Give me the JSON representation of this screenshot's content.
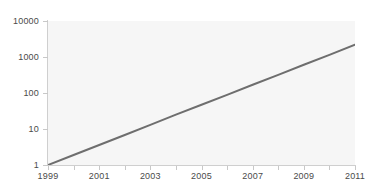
{
  "chart_data": {
    "type": "line",
    "title": "",
    "subtitle": "",
    "xlabel": "",
    "ylabel": "",
    "yscale": "log",
    "xscale": "linear",
    "grid": false,
    "legend": null,
    "legend_position": "none",
    "xlim": [
      1999,
      2011
    ],
    "ylim": [
      1,
      10000
    ],
    "ytick_labels": [
      "10000",
      "1000",
      "100",
      "10",
      "1"
    ],
    "ytick_values": [
      10000,
      1000,
      100,
      10,
      1
    ],
    "xtick_labels": [
      "1999",
      "2001",
      "2003",
      "2005",
      "2007",
      "2009",
      "2011"
    ],
    "xtick_values": [
      1999,
      2001,
      2003,
      2005,
      2007,
      2009,
      2011
    ],
    "xtick_minor_values": [
      2000,
      2002,
      2004,
      2006,
      2008,
      2010
    ],
    "series": [
      {
        "name": "",
        "color": "#6e6e6e",
        "line_width": 2,
        "x": [
          1999,
          2000,
          2001,
          2002,
          2003,
          2004,
          2005,
          2006,
          2007,
          2008,
          2009,
          2010,
          2011
        ],
        "values": [
          1,
          1.9,
          3.6,
          6.8,
          13,
          25,
          47,
          89,
          170,
          320,
          610,
          1150,
          2200
        ]
      }
    ],
    "annotations": []
  },
  "style": {
    "plot_background": "#f6f6f6",
    "page_background": "#ffffff",
    "axis_color": "#cfcfcf",
    "tick_color": "#c8c8c8",
    "label_color": "#4a4a4a",
    "line_color": "#6e6e6e"
  }
}
